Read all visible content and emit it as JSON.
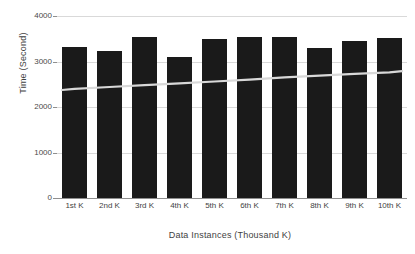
{
  "chart_data": {
    "type": "bar",
    "title": "",
    "subtitle": "",
    "xlabel": "Data Instances (Thousand K)",
    "ylabel": "Time (Second)",
    "categories": [
      "1st K",
      "2nd K",
      "3rd K",
      "4th K",
      "5th K",
      "6th K",
      "7th K",
      "8th K",
      "9th K",
      "10th K"
    ],
    "values": [
      3330,
      3230,
      3540,
      3100,
      3490,
      3540,
      3540,
      3300,
      3450,
      3520
    ],
    "series": [
      {
        "name": "Time",
        "type": "bar",
        "values": [
          3330,
          3230,
          3540,
          3100,
          3490,
          3540,
          3540,
          3300,
          3450,
          3520
        ]
      },
      {
        "name": "Trend",
        "type": "line",
        "values": [
          2400,
          2440,
          2480,
          2520,
          2560,
          2600,
          2650,
          2690,
          2730,
          2760
        ]
      }
    ],
    "ylim": [
      0,
      4000
    ],
    "yticks": [
      0,
      1000,
      2000,
      3000,
      4000
    ],
    "ytick_labels": [
      "0",
      "1000",
      "2000",
      "3000",
      "4000"
    ],
    "grid": true,
    "legend": false,
    "legend_position": "none",
    "bar_color": "#1a1a1a",
    "trend_color": "#d8d8d8",
    "grid_color": "#d9d9d9",
    "axis_color": "#8f8f8f",
    "background": "#ffffff"
  }
}
